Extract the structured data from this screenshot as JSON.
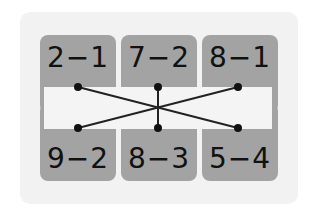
{
  "diagram": {
    "top_row": [
      {
        "label": "2−1",
        "value": 1
      },
      {
        "label": "7−2",
        "value": 5
      },
      {
        "label": "8−1",
        "value": 7
      }
    ],
    "bottom_row": [
      {
        "label": "9−2",
        "value": 7
      },
      {
        "label": "8−3",
        "value": 5
      },
      {
        "label": "5−4",
        "value": 1
      }
    ],
    "connections": [
      {
        "from": "top.0",
        "to": "bottom.2"
      },
      {
        "from": "top.1",
        "to": "bottom.1"
      },
      {
        "from": "top.2",
        "to": "bottom.0"
      }
    ],
    "colors": {
      "card": "#a3a3a3",
      "panel": "#f2f2f2",
      "strip": "#f4f4f4",
      "line": "#222222"
    }
  }
}
